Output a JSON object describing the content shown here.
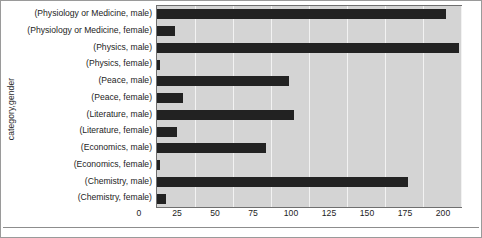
{
  "chart_data": {
    "type": "bar",
    "orientation": "horizontal",
    "title": "",
    "xlabel": "",
    "ylabel": "category,gender",
    "xlim": [
      0,
      200
    ],
    "xticks": [
      0,
      25,
      50,
      75,
      100,
      125,
      150,
      175,
      200
    ],
    "grid": true,
    "legend": "none",
    "bar_color": "#222222",
    "plot_background": "#d4d4d4",
    "categories": [
      "(Physiology or Medicine, male)",
      "(Physiology or Medicine, female)",
      "(Physics, male)",
      "(Physics, female)",
      "(Peace, male)",
      "(Peace, female)",
      "(Literature, male)",
      "(Literature, female)",
      "(Economics, male)",
      "(Economics, female)",
      "(Chemistry, male)",
      "(Chemistry, female)"
    ],
    "values": [
      190,
      12,
      199,
      2,
      87,
      17,
      90,
      13,
      72,
      2,
      165,
      6
    ]
  }
}
